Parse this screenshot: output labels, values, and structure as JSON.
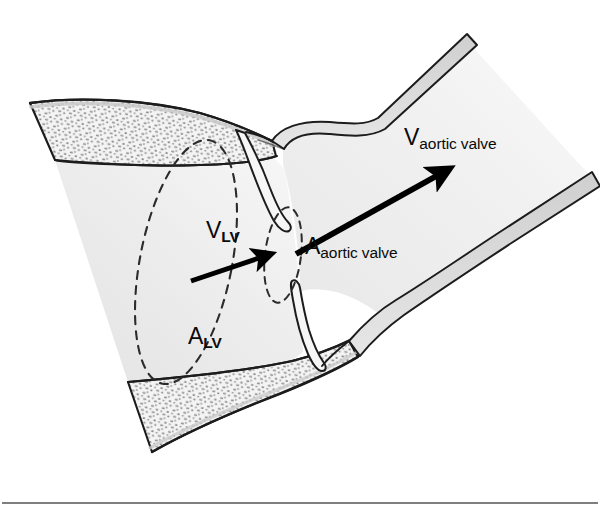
{
  "figure": {
    "name": "aortic-valve-continuity-equation-diagram",
    "background_color": "#ffffff",
    "ink_color": "#1a1a1a",
    "lumen_fill": "#efefef",
    "wall_fill": "#d4d4d4",
    "myocardium_fill": "#f2f2f2",
    "stipple_color": "#8a8a8a"
  },
  "labels": {
    "v_aortic_valve": {
      "symbol": "V",
      "subscript": "aortic valve",
      "name": "velocity-aortic-valve-label"
    },
    "a_aortic_valve": {
      "symbol": "A",
      "subscript": "aortic valve",
      "name": "area-aortic-valve-label"
    },
    "v_lv": {
      "symbol": "V",
      "subscript": "LV",
      "name": "velocity-left-ventricle-label"
    },
    "a_lv": {
      "symbol": "A",
      "subscript": "LV",
      "name": "area-left-ventricle-label"
    }
  },
  "arrows": [
    {
      "id": "arrow-aortic-valve-flow",
      "label_key": "v_aortic_valve",
      "from": [
        296,
        254
      ],
      "to": [
        449,
        169
      ],
      "stroke_width": 6,
      "color": "#000000"
    },
    {
      "id": "arrow-lv-flow",
      "label_key": "v_lv",
      "from": [
        191,
        281
      ],
      "to": [
        270,
        254
      ],
      "stroke_width": 5,
      "color": "#000000"
    }
  ],
  "dashed_outlines": [
    {
      "id": "lv-cross-section-ellipse",
      "label_key": "a_lv",
      "note": "Large tilted dashed ellipse marking the left ventricular outflow cross-sectional area",
      "center": [
        186,
        262
      ],
      "rx": 46,
      "ry": 124,
      "rotation_deg": 11
    },
    {
      "id": "aortic-valve-orifice-ellipse",
      "label_key": "a_aortic_valve",
      "note": "Small dashed ellipse marking the aortic valve orifice cross-sectional area",
      "center": [
        283,
        255
      ],
      "rx": 18,
      "ry": 48,
      "rotation_deg": 7
    }
  ],
  "structures": [
    {
      "id": "left-ventricle-chamber",
      "name": "left-ventricle-lumen"
    },
    {
      "id": "myocardium-superior",
      "name": "myocardial-wall-upper"
    },
    {
      "id": "myocardium-inferior",
      "name": "myocardial-wall-lower"
    },
    {
      "id": "aorta-lumen",
      "name": "aortic-lumen"
    },
    {
      "id": "aortic-wall-upper",
      "name": "aortic-wall-upper"
    },
    {
      "id": "aortic-wall-lower",
      "name": "aortic-wall-lower"
    },
    {
      "id": "valve-leaflet-upper",
      "name": "aortic-valve-leaflet-upper"
    },
    {
      "id": "valve-leaflet-lower",
      "name": "aortic-valve-leaflet-lower"
    }
  ],
  "footer_rule": {
    "name": "footer-divider-rule",
    "y": 503,
    "x_start": 2,
    "x_end": 598,
    "color": "#555555"
  }
}
